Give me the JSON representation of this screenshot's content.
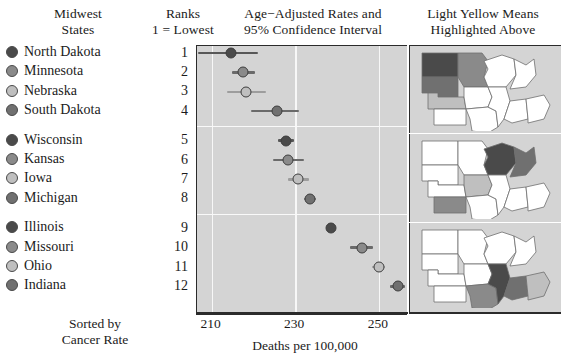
{
  "headers": {
    "states": "Midwest\nStates",
    "ranks": "Ranks\n1 = Lowest",
    "rates": "Age−Adjusted Rates and\n95% Confidence Interval",
    "maps": "Light Yellow Means\nHighlighted Above"
  },
  "footer_note": "Sorted by\nCancer Rate",
  "axis": {
    "xlabel": "Deaths per 100,000",
    "ticks": [
      "210",
      "230",
      "250"
    ],
    "tick_values": [
      210,
      230,
      250
    ],
    "xmin": 206.5,
    "xmax": 257
  },
  "shades": {
    "darkest": "#4a4a4a",
    "medium": "#8a8a8a",
    "lightest": "#bfbfbf",
    "mediumdark": "#707070",
    "panel_bg": "#d4d4d4",
    "grid": "#f7f7f7",
    "map_unhighlighted": "#ffffff",
    "axis": "#2b2b2b"
  },
  "chart_data": {
    "type": "scatter",
    "title": "Age−Adjusted Rates and 95% Confidence Interval",
    "xlabel": "Deaths per 100,000",
    "ylabel": "Midwest States",
    "xlim": [
      206.5,
      257
    ],
    "grid": true,
    "legend": "none",
    "categories": [
      "North Dakota",
      "Minnesota",
      "Nebraska",
      "South Dakota",
      "Wisconsin",
      "Kansas",
      "Iowa",
      "Michigan",
      "Illinois",
      "Missouri",
      "Ohio",
      "Indiana"
    ],
    "ranks": [
      1,
      2,
      3,
      4,
      5,
      6,
      7,
      8,
      9,
      10,
      11,
      12
    ],
    "values": [
      214.6,
      217.6,
      218.3,
      225.6,
      227.8,
      228.3,
      230.7,
      233.5,
      238.5,
      246.0,
      250.0,
      254.5
    ],
    "ci_low": [
      206.8,
      214.9,
      213.7,
      219.5,
      226.0,
      224.7,
      228.2,
      232.1,
      237.5,
      243.2,
      248.4,
      252.8
    ],
    "ci_high": [
      221.0,
      220.4,
      223.1,
      230.9,
      229.7,
      232.0,
      233.3,
      235.0,
      239.6,
      248.7,
      251.6,
      256.3
    ],
    "shade_cycle": [
      "darkest",
      "medium",
      "lightest",
      "mediumdark"
    ]
  },
  "rows": [
    {
      "state": "North Dakota",
      "rank": "1",
      "value": 214.6,
      "ci_low": 206.8,
      "ci_high": 221.0,
      "shade": "darkest",
      "group": 1
    },
    {
      "state": "Minnesota",
      "rank": "2",
      "value": 217.6,
      "ci_low": 214.9,
      "ci_high": 220.4,
      "shade": "medium",
      "group": 1
    },
    {
      "state": "Nebraska",
      "rank": "3",
      "value": 218.3,
      "ci_low": 213.7,
      "ci_high": 223.1,
      "shade": "lightest",
      "group": 1
    },
    {
      "state": "South Dakota",
      "rank": "4",
      "value": 225.6,
      "ci_low": 219.5,
      "ci_high": 230.9,
      "shade": "mediumdark",
      "group": 1
    },
    {
      "state": "Wisconsin",
      "rank": "5",
      "value": 227.8,
      "ci_low": 226.0,
      "ci_high": 229.7,
      "shade": "darkest",
      "group": 2
    },
    {
      "state": "Kansas",
      "rank": "6",
      "value": 228.3,
      "ci_low": 224.7,
      "ci_high": 232.0,
      "shade": "medium",
      "group": 2
    },
    {
      "state": "Iowa",
      "rank": "7",
      "value": 230.7,
      "ci_low": 228.2,
      "ci_high": 233.3,
      "shade": "lightest",
      "group": 2
    },
    {
      "state": "Michigan",
      "rank": "8",
      "value": 233.5,
      "ci_low": 232.1,
      "ci_high": 235.0,
      "shade": "mediumdark",
      "group": 2
    },
    {
      "state": "Illinois",
      "rank": "9",
      "value": 238.5,
      "ci_low": 237.5,
      "ci_high": 239.6,
      "shade": "darkest",
      "group": 3
    },
    {
      "state": "Missouri",
      "rank": "10",
      "value": 246.0,
      "ci_low": 243.2,
      "ci_high": 248.7,
      "shade": "medium",
      "group": 3
    },
    {
      "state": "Ohio",
      "rank": "11",
      "value": 250.0,
      "ci_low": 248.4,
      "ci_high": 251.6,
      "shade": "lightest",
      "group": 3
    },
    {
      "state": "Indiana",
      "rank": "12",
      "value": 254.5,
      "ci_low": 252.8,
      "ci_high": 256.3,
      "shade": "mediumdark",
      "group": 3
    }
  ],
  "maps": [
    {
      "panel": 1,
      "highlighted": [
        "North Dakota",
        "Minnesota",
        "Nebraska",
        "South Dakota"
      ]
    },
    {
      "panel": 2,
      "highlighted": [
        "Wisconsin",
        "Kansas",
        "Iowa",
        "Michigan"
      ]
    },
    {
      "panel": 3,
      "highlighted": [
        "Illinois",
        "Missouri",
        "Ohio",
        "Indiana"
      ]
    }
  ]
}
